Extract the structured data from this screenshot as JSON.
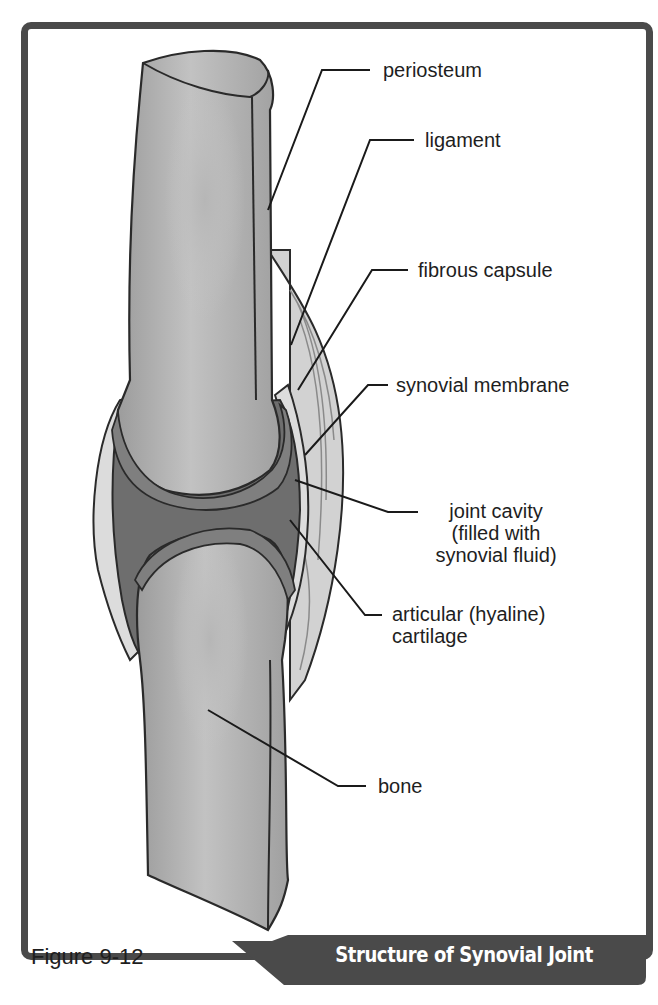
{
  "figure": {
    "number_label": "Figure 9-12",
    "title": "Structure of Synovial Joint"
  },
  "labels": {
    "periosteum": "periosteum",
    "ligament": "ligament",
    "fibrous_capsule": "fibrous capsule",
    "synovial_membrane": "synovial membrane",
    "joint_cavity": [
      "joint cavity",
      "(filled with",
      "synovial fluid)"
    ],
    "articular_cartilage": [
      "articular (hyaline)",
      "cartilage"
    ],
    "bone": "bone"
  },
  "colors": {
    "frame": "#4a4a4a",
    "bone": "#a8a8a8",
    "cartilage": "#7f7f7f",
    "cavity": "#6e6e6e",
    "capsule": "#d4d4d4",
    "text": "#1e1e1e"
  }
}
